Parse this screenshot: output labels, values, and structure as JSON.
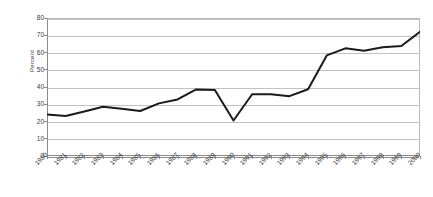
{
  "chart_data": {
    "type": "line",
    "title": "",
    "subtitle": "",
    "xlabel": "",
    "ylabel": "Percent",
    "x": [
      1980,
      1981,
      1982,
      1983,
      1984,
      1985,
      1986,
      1987,
      1988,
      1989,
      1990,
      1991,
      1992,
      1993,
      1994,
      1995,
      1996,
      1997,
      1998,
      1999,
      2000
    ],
    "categories": [
      "1980",
      "1981",
      "1982",
      "1983",
      "1984",
      "1985",
      "1986",
      "1987",
      "1988",
      "1989",
      "1990",
      "1991",
      "1992",
      "1993",
      "1994",
      "1995",
      "1996",
      "1997",
      "1998",
      "1999",
      "2000"
    ],
    "series": [
      {
        "name": "Percent",
        "values": [
          24.0,
          23.2,
          25.8,
          28.6,
          27.4,
          26.1,
          30.5,
          32.8,
          38.6,
          38.3,
          20.6,
          35.8,
          35.8,
          34.7,
          38.7,
          58.3,
          62.4,
          61.0,
          63.0,
          63.8,
          72.0
        ],
        "color": "#1a1a1a"
      }
    ],
    "xlim": [
      1980,
      2000
    ],
    "ylim": [
      0,
      80
    ],
    "yticks": [
      0,
      10,
      20,
      30,
      40,
      50,
      60,
      70,
      80
    ],
    "ytick_labels": [
      "0",
      "10",
      "20",
      "30",
      "40",
      "50",
      "60",
      "70",
      "80"
    ],
    "grid": true,
    "grid_axis": "y",
    "legend": false,
    "legend_position": "none",
    "line_width": 2,
    "markers": false,
    "annotations": []
  },
  "style": {
    "background": "#ffffff",
    "grid_color": "#c2c2c2",
    "axis_color": "#8a8a8a",
    "text_color": "#3b3b3b",
    "series_color": "#1a1a1a"
  }
}
